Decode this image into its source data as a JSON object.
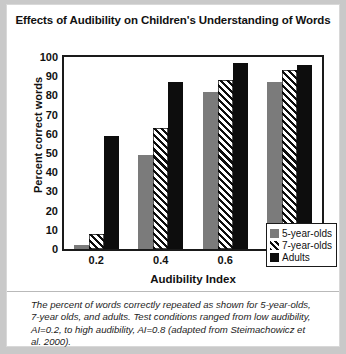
{
  "figure": {
    "title": "Effects of Audibility on Children's Understanding of Words",
    "caption": "The percent of words correctly repeated as shown for 5-year-olds, 7-year olds, and adults. Test conditions ranged from low audibility, AI=0.2, to high audibility, AI=0.8 (adapted from Steimachowicz et al. 2000)."
  },
  "chart_data": {
    "type": "bar",
    "title": "Effects of Audibility on Children's Understanding of Words",
    "xlabel": "Audibility Index",
    "ylabel": "Percent correct words",
    "categories": [
      "0.2",
      "0.4",
      "0.6",
      "0.8"
    ],
    "series": [
      {
        "name": "5-year-olds",
        "color": "#7b7b7b",
        "fill": "solid-gray",
        "values": [
          2,
          49,
          82,
          87
        ]
      },
      {
        "name": "7-year-olds",
        "color": "#0d0d0d",
        "fill": "diagonal-hatch",
        "values": [
          8,
          63,
          88,
          93
        ]
      },
      {
        "name": "Adults",
        "color": "#0d0d0d",
        "fill": "solid-black",
        "values": [
          59,
          87,
          97,
          96
        ]
      }
    ],
    "ylim": [
      0,
      100
    ],
    "yticks": [
      0,
      10,
      20,
      30,
      40,
      50,
      60,
      70,
      80,
      90,
      100
    ],
    "grid": false,
    "legend_position": "bottom-right"
  }
}
